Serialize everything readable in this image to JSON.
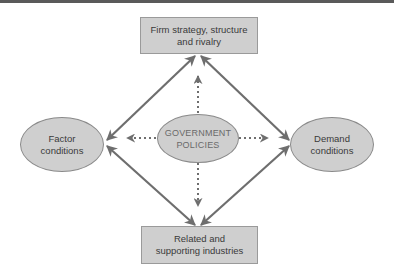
{
  "diagram": {
    "type": "porter-diamond",
    "nodes": {
      "top": {
        "line1": "Firm strategy, structure",
        "line2": "and rivalry"
      },
      "left": {
        "line1": "Factor",
        "line2": "conditions"
      },
      "right": {
        "line1": "Demand",
        "line2": "conditions"
      },
      "bottom": {
        "line1": "Related and",
        "line2": "supporting industries"
      },
      "center": {
        "line1": "GOVERNMENT",
        "line2": "POLICIES"
      }
    },
    "edges": [
      {
        "from": "top",
        "to": "left",
        "style": "solid",
        "arrows": "both"
      },
      {
        "from": "top",
        "to": "right",
        "style": "solid",
        "arrows": "both"
      },
      {
        "from": "bottom",
        "to": "left",
        "style": "solid",
        "arrows": "both"
      },
      {
        "from": "bottom",
        "to": "right",
        "style": "solid",
        "arrows": "both"
      },
      {
        "from": "center",
        "to": "top",
        "style": "dotted",
        "arrows": "end"
      },
      {
        "from": "center",
        "to": "left",
        "style": "dotted",
        "arrows": "end"
      },
      {
        "from": "center",
        "to": "right",
        "style": "dotted",
        "arrows": "end"
      },
      {
        "from": "center",
        "to": "bottom",
        "style": "dotted",
        "arrows": "end"
      }
    ],
    "colors": {
      "fill": "#cfcfcf",
      "line": "#6e6e6e",
      "text": "#3a3a3a",
      "center_text": "#6a6a6a",
      "top_bar": "#5a5a5a"
    }
  }
}
